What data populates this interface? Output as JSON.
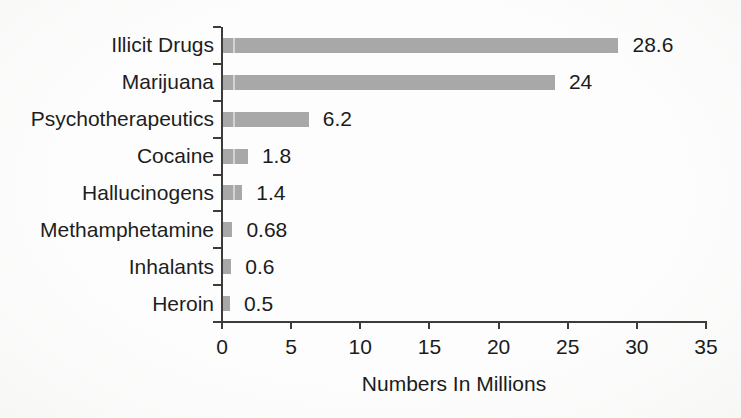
{
  "chart_data": {
    "type": "bar",
    "orientation": "horizontal",
    "title": "",
    "xlabel": "Numbers In Millions",
    "ylabel": "",
    "categories": [
      "Illicit Drugs",
      "Marijuana",
      "Psychotherapeutics",
      "Cocaine",
      "Hallucinogens",
      "Methamphetamine",
      "Inhalants",
      "Heroin"
    ],
    "values": [
      28.6,
      24,
      6.2,
      1.8,
      1.4,
      0.68,
      0.6,
      0.5
    ],
    "value_labels": [
      "28.6",
      "24",
      "6.2",
      "1.8",
      "1.4",
      "0.68",
      "0.6",
      "0.5"
    ],
    "xlim": [
      0,
      35
    ],
    "xticks": [
      0,
      5,
      10,
      15,
      20,
      25,
      30,
      35
    ],
    "grid": "off",
    "legend": "none",
    "colors": {
      "bar": "#a8a8a8",
      "axis": "#3c3c3c",
      "text": "#1b1b1b",
      "background": "#fcfcfc"
    }
  }
}
